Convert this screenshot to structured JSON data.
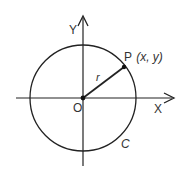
{
  "diagram": {
    "type": "unit-circle-coordinate",
    "colors": {
      "stroke": "#222222",
      "text": "#333333",
      "background": "#ffffff"
    },
    "labels": {
      "y_axis": "Y",
      "x_axis": "X",
      "origin": "O",
      "point": "P",
      "point_coords": "(x, y)",
      "radius": "r",
      "circle": "C"
    },
    "geometry": {
      "origin": [
        83,
        98
      ],
      "radius": 53,
      "point_P": [
        124,
        67
      ]
    }
  }
}
